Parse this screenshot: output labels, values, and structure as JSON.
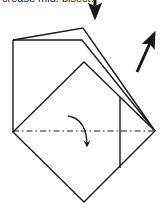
{
  "caption": {
    "text": "crease mid, bisect."
  },
  "diagram": {
    "stroke_color": "#1a1a1a",
    "background": "#ffffff",
    "shapes": {
      "upper_flap": "M13,40 L83,28 L155,131",
      "lower_flap": "M13,40 L82,40 L155,131",
      "left_edge": "M13,40 L13,132",
      "diamond": "M13,132 L84,62 L155,131 L84,202 Z",
      "vertical_crease": "M120,97 L120,168",
      "fold_line": {
        "x1": 13,
        "y1": 131,
        "x2": 155,
        "y2": 131
      }
    },
    "arrows": [
      {
        "name": "push-down-arrow",
        "from": [
          95,
          0
        ],
        "to": [
          95,
          20
        ]
      },
      {
        "name": "lift-up-arrow",
        "from": [
          137,
          72
        ],
        "to": [
          157,
          28
        ]
      },
      {
        "name": "fold-down-curved-arrow",
        "path": "M68,116 Q86,120 86,148"
      }
    ]
  }
}
